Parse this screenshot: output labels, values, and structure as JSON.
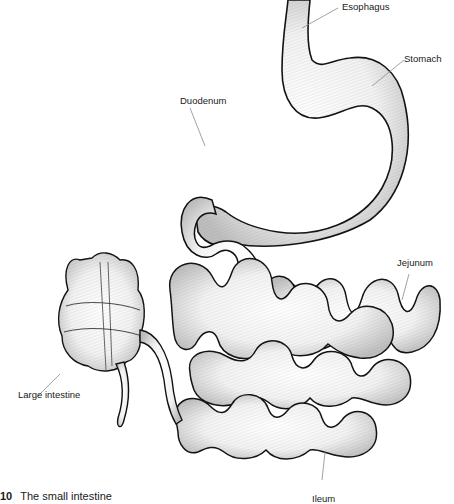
{
  "figure": {
    "caption_number": "10",
    "caption_text": "The small intestine",
    "labels": {
      "esophagus": "Esophagus",
      "stomach": "Stomach",
      "duodenum": "Duodenum",
      "jejunum": "Jejunum",
      "large_intestine": "Large intestine",
      "ileum": "Ileum"
    },
    "colors": {
      "outline": "#111111",
      "hatching": "#7a7a7a",
      "leader_line": "#8a8a8a",
      "text": "#1a1a1a",
      "background": "#ffffff"
    }
  }
}
